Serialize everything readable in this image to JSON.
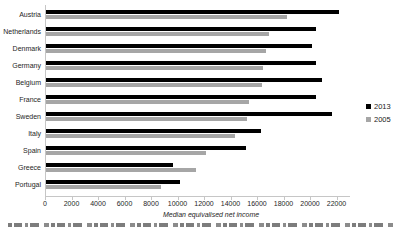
{
  "chart_data": {
    "type": "bar",
    "orientation": "horizontal",
    "title": "",
    "xlabel": "Median equivalised net income",
    "ylabel": "",
    "categories": [
      "Austria",
      "Netherlands",
      "Denmark",
      "Germany",
      "Belgium",
      "France",
      "Sweden",
      "Italy",
      "Spain",
      "Greece",
      "Portugal"
    ],
    "series": [
      {
        "name": "2013",
        "color": "#000000",
        "values": [
          22100,
          20400,
          20100,
          20400,
          20800,
          20400,
          21600,
          16200,
          15100,
          9600,
          10100
        ]
      },
      {
        "name": "2005",
        "color": "#a6a6a6",
        "values": [
          18200,
          16800,
          16600,
          16400,
          16300,
          15300,
          15200,
          14300,
          12100,
          11300,
          8700
        ]
      }
    ],
    "xlim": [
      0,
      22000
    ],
    "xticks": [
      0,
      2000,
      4000,
      6000,
      8000,
      10000,
      12000,
      14000,
      16000,
      18000,
      20000,
      22000
    ],
    "grid": false,
    "legend_position": "right"
  }
}
